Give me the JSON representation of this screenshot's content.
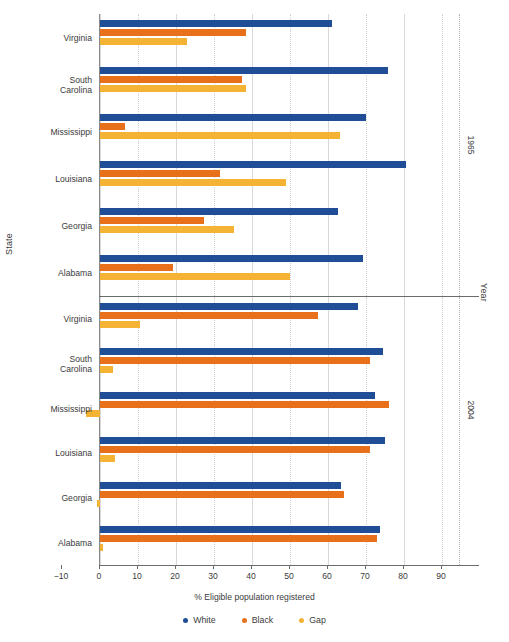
{
  "chart_data": {
    "type": "bar",
    "orientation": "horizontal",
    "title": "",
    "xlabel": "% Eligible population registered",
    "ylabel": "State",
    "strip_label": "Year",
    "xlim": [
      -10,
      95
    ],
    "xticks": [
      -10,
      0,
      10,
      20,
      30,
      40,
      50,
      60,
      70,
      80,
      90
    ],
    "xtick_labels": [
      "−10",
      "0",
      "10",
      "20",
      "30",
      "40",
      "50",
      "60",
      "70",
      "80",
      "90"
    ],
    "grid": true,
    "legend_position": "bottom",
    "series": [
      {
        "name": "White",
        "color": "#1f4e96"
      },
      {
        "name": "Black",
        "color": "#e8701a"
      },
      {
        "name": "Gap",
        "color": "#f5b335"
      }
    ],
    "panels": [
      {
        "year": "1965",
        "categories": [
          "Virginia",
          "South Carolina",
          "Mississippi",
          "Louisiana",
          "Georgia",
          "Alabama"
        ],
        "rows": [
          {
            "state": "Virginia",
            "state_line1": "Virginia",
            "state_line2": "",
            "White": 61.1,
            "Black": 38.3,
            "Gap": 22.8
          },
          {
            "state": "South Carolina",
            "state_line1": "South",
            "state_line2": "Carolina",
            "White": 75.7,
            "Black": 37.3,
            "Gap": 38.4
          },
          {
            "state": "Mississippi",
            "state_line1": "Mississippi",
            "state_line2": "",
            "White": 69.9,
            "Black": 6.7,
            "Gap": 63.2
          },
          {
            "state": "Louisiana",
            "state_line1": "Louisiana",
            "state_line2": "",
            "White": 80.5,
            "Black": 31.6,
            "Gap": 48.9
          },
          {
            "state": "Georgia",
            "state_line1": "Georgia",
            "state_line2": "",
            "White": 62.6,
            "Black": 27.4,
            "Gap": 35.2
          },
          {
            "state": "Alabama",
            "state_line1": "Alabama",
            "state_line2": "",
            "White": 69.2,
            "Black": 19.3,
            "Gap": 49.9
          }
        ]
      },
      {
        "year": "2004",
        "categories": [
          "Virginia",
          "South Carolina",
          "Mississippi",
          "Louisiana",
          "Georgia",
          "Alabama"
        ],
        "rows": [
          {
            "state": "Virginia",
            "state_line1": "Virginia",
            "state_line2": "",
            "White": 68.0,
            "Black": 57.4,
            "Gap": 10.6
          },
          {
            "state": "South Carolina",
            "state_line1": "South",
            "state_line2": "Carolina",
            "White": 74.4,
            "Black": 71.1,
            "Gap": 3.3
          },
          {
            "state": "Mississippi",
            "state_line1": "Mississippi",
            "state_line2": "",
            "White": 72.3,
            "Black": 76.1,
            "Gap": -3.8
          },
          {
            "state": "Louisiana",
            "state_line1": "Louisiana",
            "state_line2": "",
            "White": 75.1,
            "Black": 71.1,
            "Gap": 4.0
          },
          {
            "state": "Georgia",
            "state_line1": "Georgia",
            "state_line2": "",
            "White": 63.5,
            "Black": 64.2,
            "Gap": -0.7
          },
          {
            "state": "Alabama",
            "state_line1": "Alabama",
            "state_line2": "",
            "White": 73.8,
            "Black": 72.9,
            "Gap": 0.9
          }
        ]
      }
    ]
  },
  "legend": {
    "items": [
      {
        "label": "White",
        "color": "#1f4e96"
      },
      {
        "label": "Black",
        "color": "#e8701a"
      },
      {
        "label": "Gap",
        "color": "#f5b335"
      }
    ]
  }
}
